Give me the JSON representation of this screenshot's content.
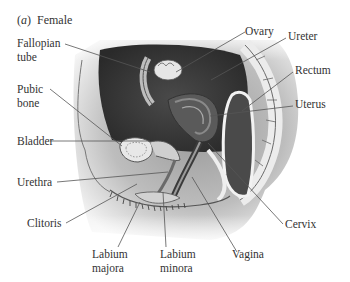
{
  "figure": {
    "panel_letter": "a",
    "panel_title": "Female"
  },
  "labels": {
    "fallopian_tube": [
      "Fallopian",
      "tube"
    ],
    "pubic_bone": [
      "Pubic",
      "bone"
    ],
    "bladder": "Bladder",
    "urethra": "Urethra",
    "clitoris": "Clitoris",
    "labium_majora": [
      "Labium",
      "majora"
    ],
    "labium_minora": [
      "Labium",
      "minora"
    ],
    "vagina": "Vagina",
    "cervix": "Cervix",
    "ovary": "Ovary",
    "ureter": "Ureter",
    "rectum": "Rectum",
    "uterus": "Uterus"
  },
  "colors": {
    "background": "#ffffff",
    "text": "#333333",
    "leader_line": "#555555",
    "cavity_dark": "#3a3a3a",
    "tissue_mid": "#8a8a8a",
    "tissue_light": "#d8d8d8"
  }
}
